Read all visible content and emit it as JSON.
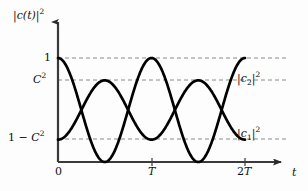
{
  "figure": {
    "background": "#fdfdfd",
    "curve_color": "#000000",
    "axis_color": "#3a3a3a",
    "grid_color": "#8a8a8a",
    "width": 308,
    "height": 191
  },
  "axes": {
    "y_axis_label": "|c(t)|²",
    "y_axis_label_parts": {
      "pre": "|",
      "var": "c",
      "arg": "(t)",
      "post": "|",
      "exp": "2"
    },
    "x_axis_label": "t",
    "y_ticks": [
      {
        "value": 1,
        "label": "1",
        "pixel_y": 58
      },
      {
        "value": "C^2",
        "label": "C²",
        "pixel_y": 80
      },
      {
        "value": "1-C^2",
        "label": "1 − C²",
        "pixel_y": 139
      },
      {
        "value": 0,
        "label": "0",
        "pixel_y": 162
      }
    ],
    "x_ticks": [
      {
        "value": 0,
        "label": "0",
        "pixel_x": 58
      },
      {
        "value": "T",
        "label": "T",
        "pixel_x": 152
      },
      {
        "value": "2T",
        "label": "2T",
        "pixel_x": 245
      }
    ],
    "gridlines": "dashed horizontal at 1, C² and 1−C²",
    "arrowheads": [
      "y-axis-top",
      "x-axis-right"
    ]
  },
  "curve_labels": {
    "upper": {
      "text": "|c₂|²",
      "base": "c",
      "sub": "2",
      "exp": "2",
      "level": "C^2"
    },
    "lower": {
      "text": "|c₁|²",
      "base": "c",
      "sub": "1",
      "exp": "2",
      "level": "1-C^2"
    }
  },
  "chart_data": {
    "type": "line",
    "title": "",
    "xlabel": "t",
    "ylabel": "|c(t)|²",
    "xlim": [
      0,
      2.45
    ],
    "ylim": [
      0,
      1.13
    ],
    "xtick_values": [
      0,
      1,
      2
    ],
    "xtick_labels": [
      "0",
      "T",
      "2T"
    ],
    "ytick_values": [
      0,
      0.785,
      0.215,
      1
    ],
    "ytick_labels": [
      "0",
      "C²",
      "1 − C²",
      "1"
    ],
    "grid": "horizontal-dashed",
    "legend": "inline-right",
    "constants": {
      "C_squared": 0.785,
      "one_minus_C_squared": 0.215,
      "period_T": 1
    },
    "series": [
      {
        "name": "|c1|²",
        "formula": "cos^2(pi*t/T)",
        "amplitude_min": 0,
        "amplitude_max": 1,
        "period": 2,
        "description": "Starts at 1 at t=0, falls to 0 at t=T, returns to 1 at t=2T",
        "x": [
          0,
          0.125,
          0.25,
          0.375,
          0.5,
          0.625,
          0.75,
          0.875,
          1.0,
          1.125,
          1.25,
          1.375,
          1.5,
          1.625,
          1.75,
          1.875,
          2.0
        ],
        "y": [
          1.0,
          0.854,
          0.5,
          0.146,
          0.0,
          0.146,
          0.5,
          0.854,
          1.0,
          0.854,
          0.5,
          0.146,
          0.0,
          0.146,
          0.5,
          0.854,
          1.0
        ]
      },
      {
        "name": "|c2|²",
        "formula": "(1-C^2) + (2C^2-1)*sin^2(pi*t/T)  [oscillates between 1-C^2 and C^2]",
        "amplitude_min": 0.215,
        "amplitude_max": 0.785,
        "period": 1,
        "description": "Starts at 1−C² at t=0, peaks at C² at t=T/2, returns to 1−C² at t=T, repeating each T",
        "x": [
          0,
          0.125,
          0.25,
          0.375,
          0.5,
          0.625,
          0.75,
          0.875,
          1.0,
          1.125,
          1.25,
          1.375,
          1.5,
          1.625,
          1.75,
          1.875,
          2.0
        ],
        "y": [
          0.215,
          0.298,
          0.5,
          0.702,
          0.785,
          0.702,
          0.5,
          0.298,
          0.215,
          0.298,
          0.5,
          0.702,
          0.785,
          0.702,
          0.5,
          0.298,
          0.215
        ]
      }
    ],
    "crossings": [
      {
        "t": 0.25,
        "y": 0.5
      },
      {
        "t": 0.75,
        "y": 0.5
      },
      {
        "t": 1.25,
        "y": 0.5
      },
      {
        "t": 1.75,
        "y": 0.5
      }
    ]
  }
}
